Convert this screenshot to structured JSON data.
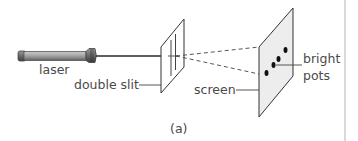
{
  "figure": {
    "caption": "(a)",
    "labels": {
      "laser": "laser",
      "double_slit": "double slit",
      "screen": "screen",
      "bright_spots_line1": "bright",
      "bright_spots_line2": "pots"
    },
    "components": [
      {
        "name": "laser",
        "type": "light-source"
      },
      {
        "name": "double slit",
        "type": "barrier-with-two-slits"
      },
      {
        "name": "screen",
        "type": "projection-screen"
      },
      {
        "name": "bright spots",
        "type": "interference-dots",
        "count": 4
      }
    ],
    "colors": {
      "line": "#333333",
      "label_text": "#4a4a4a",
      "screen_fill": "#ededed",
      "laser_body": "#9a9a9a",
      "border": "#d9d9d9"
    }
  }
}
